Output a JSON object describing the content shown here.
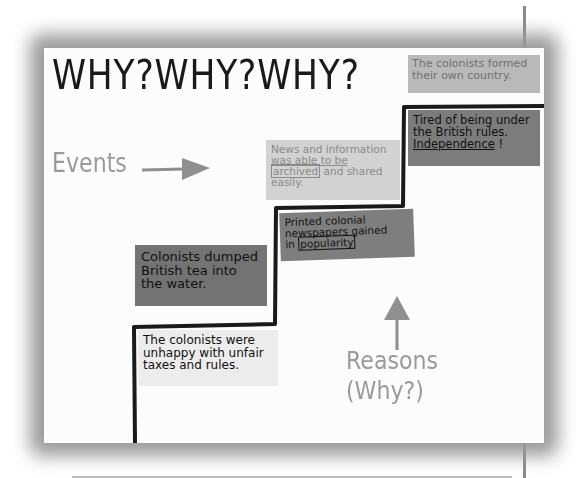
{
  "poster": {
    "title": "WHY?WHY?WHY?",
    "labels": {
      "events": "Events",
      "reasons_line1": "Reasons",
      "reasons_line2": "(Why?)"
    },
    "cards": {
      "result": {
        "line1": "The colonists formed",
        "line2": "their own country."
      },
      "independence": {
        "line1": "Tired of being under",
        "line2": "the British rules.",
        "line3": "Independence",
        "line3_suffix": " !"
      },
      "news": {
        "line1": "News and information",
        "line2": "was able to be",
        "line3_boxed": "archived",
        "line3_rest": " and shared",
        "line4": "easily."
      },
      "newspapers": {
        "line1": "Printed colonial",
        "line2": "newspapers gained",
        "line3_prefix": "in ",
        "line3_boxed": "popularity"
      },
      "tea": {
        "line1": "Colonists dumped",
        "line2": "British tea into",
        "line3": "the water."
      },
      "unhappy": {
        "line1": "The colonists were",
        "line2": "unhappy with unfair",
        "line3": "taxes and rules."
      }
    },
    "arrows": {
      "events_arrow": "right-arrow-icon",
      "reasons_arrow": "up-arrow-icon"
    },
    "colors": {
      "paper": "#fcfcfc",
      "staircase_line": "#1a1a1a",
      "dark_card": "#7c7c7c",
      "light_card": "#d2d2d2",
      "label_gray": "#9a9a9a"
    }
  }
}
